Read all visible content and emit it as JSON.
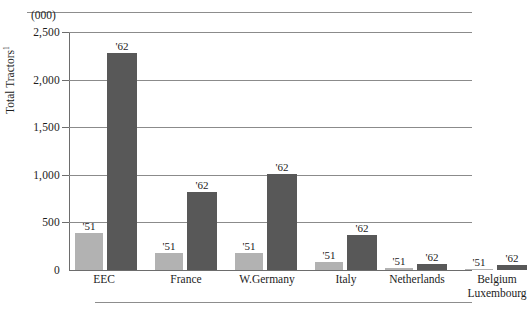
{
  "chart_data": {
    "type": "bar",
    "title": "",
    "subtitle": "",
    "unit_caption": "(000)",
    "ylabel": "Total Tractors",
    "ylabel_superscript": "1",
    "xlabel": "",
    "ylim": [
      0,
      2500
    ],
    "yticks": [
      0,
      500,
      1000,
      1500,
      2000,
      2500
    ],
    "ytick_labels": [
      "0",
      "500",
      "1,000",
      "1,500",
      "2,000",
      "2,500"
    ],
    "grid": true,
    "grid_axis": "y",
    "legend": "none",
    "categories": [
      "EEC",
      "France",
      "W.Germany",
      "Italy",
      "Netherlands",
      "Belgium Luxembourg"
    ],
    "category_lines": [
      [
        "EEC"
      ],
      [
        "France"
      ],
      [
        "W.Germany"
      ],
      [
        "Italy"
      ],
      [
        "Netherlands"
      ],
      [
        "Belgium",
        "Luxembourg"
      ]
    ],
    "series": [
      {
        "name": "'51",
        "color": "#b2b2b2",
        "values": [
          390,
          175,
          180,
          80,
          20,
          15
        ]
      },
      {
        "name": "'62",
        "color": "#585858",
        "values": [
          2280,
          820,
          1010,
          370,
          60,
          55
        ]
      }
    ],
    "bar_labels": [
      [
        "'51",
        "'62"
      ],
      [
        "'51",
        "'62"
      ],
      [
        "'51",
        "'62"
      ],
      [
        "'51",
        "'62"
      ],
      [
        "'51",
        "'62"
      ],
      [
        "'51",
        "'62"
      ]
    ]
  },
  "colors": {
    "series_51": "#b2b2b2",
    "series_62": "#585858",
    "gridline": "#8b8b8b",
    "axis": "#6d6d6d",
    "text": "#1c1c1c",
    "background": "#ffffff"
  },
  "layout": {
    "groups": [
      {
        "left": 6,
        "width": 62,
        "bar51_w": 28,
        "bar62_w": 30,
        "gap": 4,
        "label_left": -2,
        "label_width": 74
      },
      {
        "left": 86,
        "width": 62,
        "bar51_w": 28,
        "bar62_w": 30,
        "gap": 4,
        "label_left": 78,
        "label_width": 78
      },
      {
        "left": 166,
        "width": 62,
        "bar51_w": 28,
        "bar62_w": 30,
        "gap": 4,
        "label_left": 156,
        "label_width": 84
      },
      {
        "left": 246,
        "width": 62,
        "bar51_w": 28,
        "bar62_w": 30,
        "gap": 4,
        "label_left": 238,
        "label_width": 78
      },
      {
        "left": 316,
        "width": 62,
        "bar51_w": 28,
        "bar62_w": 30,
        "gap": 4,
        "label_left": 306,
        "label_width": 84
      },
      {
        "left": 396,
        "width": 62,
        "bar51_w": 28,
        "bar62_w": 30,
        "gap": 4,
        "label_left": 384,
        "label_width": 88
      }
    ]
  }
}
